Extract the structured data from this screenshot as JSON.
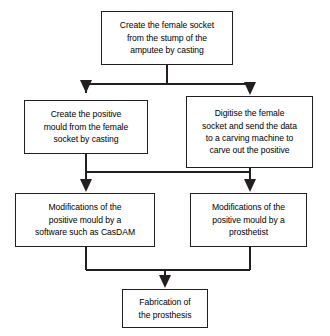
{
  "diagram": {
    "type": "flowchart",
    "background_color": "#ffffff",
    "line_color": "#231f20",
    "text_color": "#000000",
    "nodes": [
      {
        "id": "create_female_socket",
        "label": "Create the female socket\nfrom the stump of the\namputee by casting",
        "shape": "rectangle"
      },
      {
        "id": "create_positive_mould",
        "label": "Create the positive\nmould from the female\nsocket by casting",
        "shape": "rectangle"
      },
      {
        "id": "digitise_socket",
        "label": "Digitise the female\nsocket and send the data\nto a carving machine to\ncarve out the positive",
        "shape": "rectangle"
      },
      {
        "id": "modify_software",
        "label": "Modifications of the\npositive mould by a\nsoftware such as CasDAM",
        "shape": "rectangle"
      },
      {
        "id": "modify_prosthetist",
        "label": "Modifications of the\npositive mould by a\nprosthetist",
        "shape": "rectangle"
      },
      {
        "id": "fabrication",
        "label": "Fabrication of\nthe prosthesis",
        "shape": "rectangle"
      }
    ],
    "edges": [
      {
        "from": "create_female_socket",
        "to": "create_positive_mould",
        "style": "split-bus-arrow"
      },
      {
        "from": "create_female_socket",
        "to": "digitise_socket",
        "style": "split-bus-arrow"
      },
      {
        "from": "create_positive_mould",
        "to": "modify_software",
        "style": "bus-arrow"
      },
      {
        "from": "create_positive_mould",
        "to": "modify_prosthetist",
        "style": "bus-arrow"
      },
      {
        "from": "digitise_socket",
        "to": "modify_software",
        "style": "bus-arrow"
      },
      {
        "from": "digitise_socket",
        "to": "modify_prosthetist",
        "style": "bus-arrow"
      },
      {
        "from": "modify_software",
        "to": "fabrication",
        "style": "merge-bus-arrow"
      },
      {
        "from": "modify_prosthetist",
        "to": "fabrication",
        "style": "merge-bus-arrow"
      }
    ]
  }
}
